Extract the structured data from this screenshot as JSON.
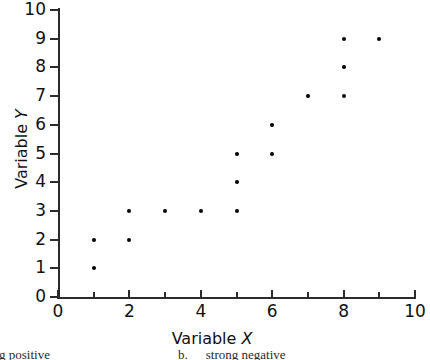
{
  "chart_data": {
    "type": "scatter",
    "title": "",
    "xlabel": "Variable X",
    "ylabel": "Variable Y",
    "xlim": [
      0,
      10
    ],
    "ylim": [
      0,
      10
    ],
    "grid": false,
    "legend": null,
    "x_ticks": [
      0,
      1,
      2,
      3,
      4,
      5,
      6,
      7,
      8,
      9,
      10
    ],
    "x_tick_labels": [
      "0",
      "",
      "2",
      "",
      "4",
      "",
      "6",
      "",
      "8",
      "",
      "10"
    ],
    "y_ticks": [
      0,
      1,
      2,
      3,
      4,
      5,
      6,
      7,
      8,
      9,
      10
    ],
    "y_tick_labels": [
      "0",
      "1",
      "2",
      "3",
      "4",
      "5",
      "6",
      "7",
      "8",
      "9",
      "10"
    ],
    "marker": "filled-circle",
    "marker_color": "#000000",
    "points": [
      {
        "x": 1,
        "y": 1
      },
      {
        "x": 1,
        "y": 2
      },
      {
        "x": 2,
        "y": 2
      },
      {
        "x": 2,
        "y": 3
      },
      {
        "x": 3,
        "y": 3
      },
      {
        "x": 4,
        "y": 3
      },
      {
        "x": 5,
        "y": 3
      },
      {
        "x": 5,
        "y": 4
      },
      {
        "x": 5,
        "y": 5
      },
      {
        "x": 6,
        "y": 5
      },
      {
        "x": 6,
        "y": 6
      },
      {
        "x": 7,
        "y": 7
      },
      {
        "x": 8,
        "y": 7
      },
      {
        "x": 8,
        "y": 8
      },
      {
        "x": 8,
        "y": 9
      },
      {
        "x": 9,
        "y": 9
      }
    ]
  },
  "axis_titles": {
    "x_name": "Variable",
    "x_symbol": "X",
    "y_name": "Variable",
    "y_symbol": "Y"
  },
  "caption": {
    "left_fragment": "ong  positive",
    "right_letter": "b.",
    "right_fragment": "strong  negative"
  },
  "colors": {
    "axis": "#2b2b2b",
    "marker": "#000000",
    "text": "#111111",
    "background": "#ffffff"
  }
}
